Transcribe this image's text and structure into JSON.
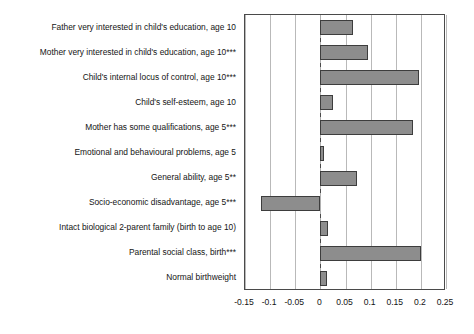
{
  "chart_data": {
    "type": "bar",
    "orientation": "horizontal",
    "title": "",
    "xlabel": "",
    "ylabel": "",
    "xlim": [
      -0.15,
      0.25
    ],
    "grid": true,
    "legend": false,
    "xticks": [
      "-0.15",
      "-0.1",
      "-0.05",
      "0",
      "0.05",
      "0.1",
      "0.15",
      "0.2",
      "0.25"
    ],
    "xtick_values": [
      -0.15,
      -0.1,
      -0.05,
      0,
      0.05,
      0.1,
      0.15,
      0.2,
      0.25
    ],
    "categories": [
      "Father very interested in child's education, age 10",
      "Mother very interested in child's education, age 10***",
      "Child's internal locus of control, age 10***",
      "Child's self-esteem, age 10",
      "Mother has some qualifications, age 5***",
      "Emotional and behavioural problems, age 5",
      "General ability, age 5**",
      "Socio-economic disadvantage, age 5***",
      "Intact biological 2-parent family (birth to age 10)",
      "Parental social class, birth***",
      "Normal birthweight"
    ],
    "values": [
      0.065,
      0.095,
      0.197,
      0.025,
      0.185,
      0.008,
      0.072,
      -0.118,
      0.015,
      0.2,
      0.013
    ],
    "bar_fill_color": "#8d8d8d",
    "bar_border_color": "#3d3d3d",
    "grid_color": "#b9b9b9",
    "frame_color": "#4a4a4a"
  }
}
